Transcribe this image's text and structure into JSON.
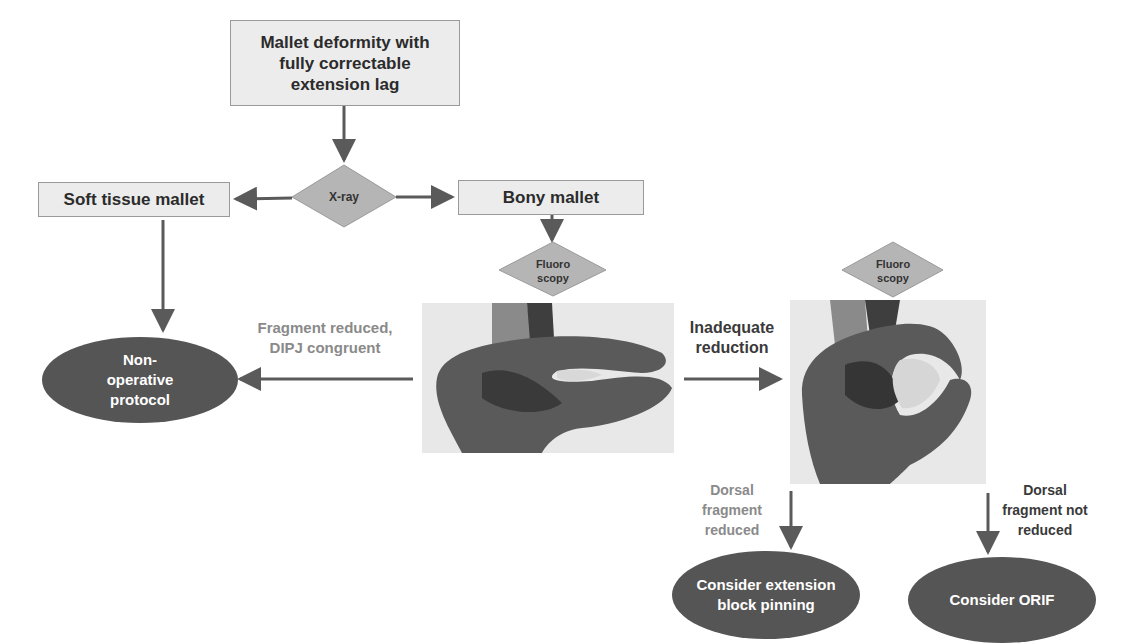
{
  "nodes": {
    "start": "Mallet deformity with fully correctable extension lag",
    "xray": "X-ray",
    "soft_tissue": "Soft tissue mallet",
    "bony": "Bony mallet",
    "fluoro_1": "Fluoro scopy",
    "fluoro_2": "Fluoro scopy",
    "non_operative": "Non-operative protocol",
    "ext_block": "Consider extension block pinning",
    "orif": "Consider ORIF"
  },
  "edge_labels": {
    "reduced": "Fragment reduced, DIPJ congruent",
    "inadequate": "Inadequate reduction",
    "dorsal_reduced": "Dorsal fragment reduced",
    "dorsal_not_reduced": "Dorsal fragment not reduced"
  },
  "images": {
    "photo_1": "hand-photo-reduced",
    "photo_2": "hand-photo-inadequate"
  },
  "colors": {
    "box_fill": "#ececec",
    "diamond_fill": "#b5b5b5",
    "oval_fill": "#555555",
    "arrow": "#5a5a5a",
    "gray_text": "#8a8a8a"
  }
}
